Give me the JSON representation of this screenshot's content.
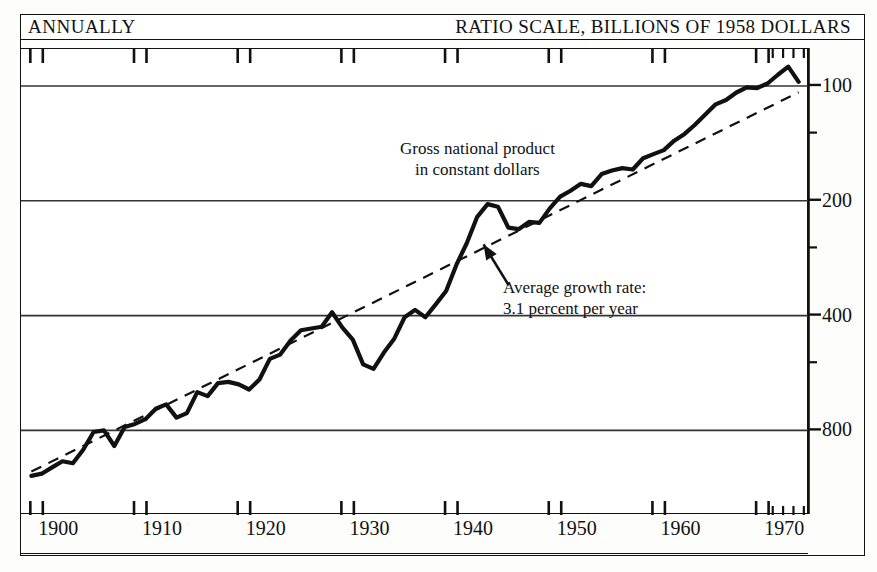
{
  "header": {
    "left_label": "ANNUALLY",
    "right_label": "RATIO SCALE, BILLIONS OF 1958 DOLLARS"
  },
  "annotations": {
    "series_label_line1": "Gross national product",
    "series_label_line2": "in constant dollars",
    "growth_label_line1": "Average growth rate:",
    "growth_label_line2": "3.1 percent per year"
  },
  "axis": {
    "y_tick_labels": [
      "800",
      "400",
      "200",
      "100"
    ],
    "x_tick_labels": [
      "1900",
      "1910",
      "1920",
      "1930",
      "1940",
      "1950",
      "1960",
      "1970"
    ]
  },
  "colors": {
    "ink": "#111111",
    "paper": "#ffffff",
    "gridline": "#333333"
  },
  "chart_data": {
    "type": "line",
    "title": "Gross national product in constant dollars",
    "subtitle": "RATIO SCALE, BILLIONS OF 1958 DOLLARS",
    "frequency": "ANNUALLY",
    "xlabel": "",
    "ylabel": "Billions of 1958 dollars",
    "yscale": "log",
    "ylim": [
      60,
      1000
    ],
    "xlim": [
      1899,
      1975
    ],
    "grid": true,
    "gridlines_y": [
      100,
      200,
      400,
      800
    ],
    "minor_ticks_y": [
      150,
      300,
      600
    ],
    "legend": "none",
    "x_major_ticks": [
      1900,
      1910,
      1920,
      1930,
      1940,
      1950,
      1960,
      1970
    ],
    "x_minor_ticks": [
      1971,
      1972,
      1973,
      1974
    ],
    "annotations": [
      {
        "text": "Gross national product in constant dollars",
        "x": 1943,
        "y": 560
      },
      {
        "text": "Average growth rate: 3.1 percent per year",
        "x": 1950,
        "y": 255,
        "arrow_to_x": 1944,
        "arrow_to_y": 300
      }
    ],
    "series": [
      {
        "name": "Gross national product in constant dollars",
        "style": "solid",
        "x": [
          1900,
          1901,
          1902,
          1903,
          1904,
          1905,
          1906,
          1907,
          1908,
          1909,
          1910,
          1911,
          1912,
          1913,
          1914,
          1915,
          1916,
          1917,
          1918,
          1919,
          1920,
          1921,
          1922,
          1923,
          1924,
          1925,
          1926,
          1927,
          1928,
          1929,
          1930,
          1931,
          1932,
          1933,
          1934,
          1935,
          1936,
          1937,
          1938,
          1939,
          1940,
          1941,
          1942,
          1943,
          1944,
          1945,
          1946,
          1947,
          1948,
          1949,
          1950,
          1951,
          1952,
          1953,
          1954,
          1955,
          1956,
          1957,
          1958,
          1959,
          1960,
          1961,
          1962,
          1963,
          1964,
          1965,
          1966,
          1967,
          1968,
          1969,
          1970,
          1971,
          1972,
          1973,
          1974
        ],
        "y": [
          76,
          77,
          80,
          83,
          82,
          89,
          99,
          100,
          91,
          102,
          104,
          107,
          114,
          117,
          108,
          111,
          126,
          123,
          133,
          134,
          132,
          128,
          136,
          154,
          158,
          172,
          183,
          185,
          187,
          204,
          186,
          173,
          149,
          145,
          160,
          174,
          198,
          207,
          198,
          214,
          232,
          272,
          310,
          363,
          392,
          386,
          340,
          337,
          352,
          350,
          382,
          410,
          425,
          443,
          437,
          470,
          480,
          487,
          483,
          517,
          530,
          543,
          575,
          599,
          633,
          673,
          716,
          735,
          769,
          793,
          790,
          812,
          856,
          899,
          820
        ]
      },
      {
        "name": "Average growth rate: 3.1 percent per year",
        "style": "dashed",
        "description": "Log-linear trend, 3.1% per year",
        "x": [
          1900,
          1974
        ],
        "y": [
          78,
          770
        ]
      }
    ]
  }
}
